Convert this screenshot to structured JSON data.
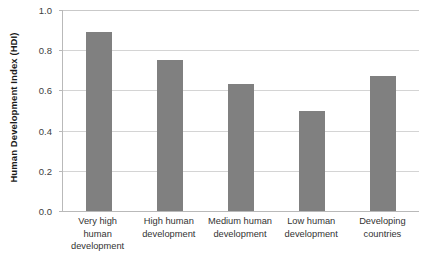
{
  "chart_data": {
    "type": "bar",
    "title": "",
    "subtitle": "",
    "xlabel": "",
    "ylabel": "Human Development Index (HDI)",
    "categories": [
      "Very high human development",
      "High human development",
      "Medium human development",
      "Low human development",
      "Developing countries"
    ],
    "values": [
      0.89,
      0.75,
      0.63,
      0.5,
      0.67
    ],
    "ylim": [
      0.0,
      1.0
    ],
    "ytick_labels": [
      "1.0",
      "0.8",
      "0.6",
      "0.4",
      "0.2",
      "0.0"
    ],
    "ytick_values": [
      1.0,
      0.8,
      0.6,
      0.4,
      0.2,
      0.0
    ],
    "grid": true,
    "legend": "none",
    "bar_color": "#808080",
    "gridline_color": "#d4d4d4",
    "axis_color": "#b9b9b9"
  }
}
